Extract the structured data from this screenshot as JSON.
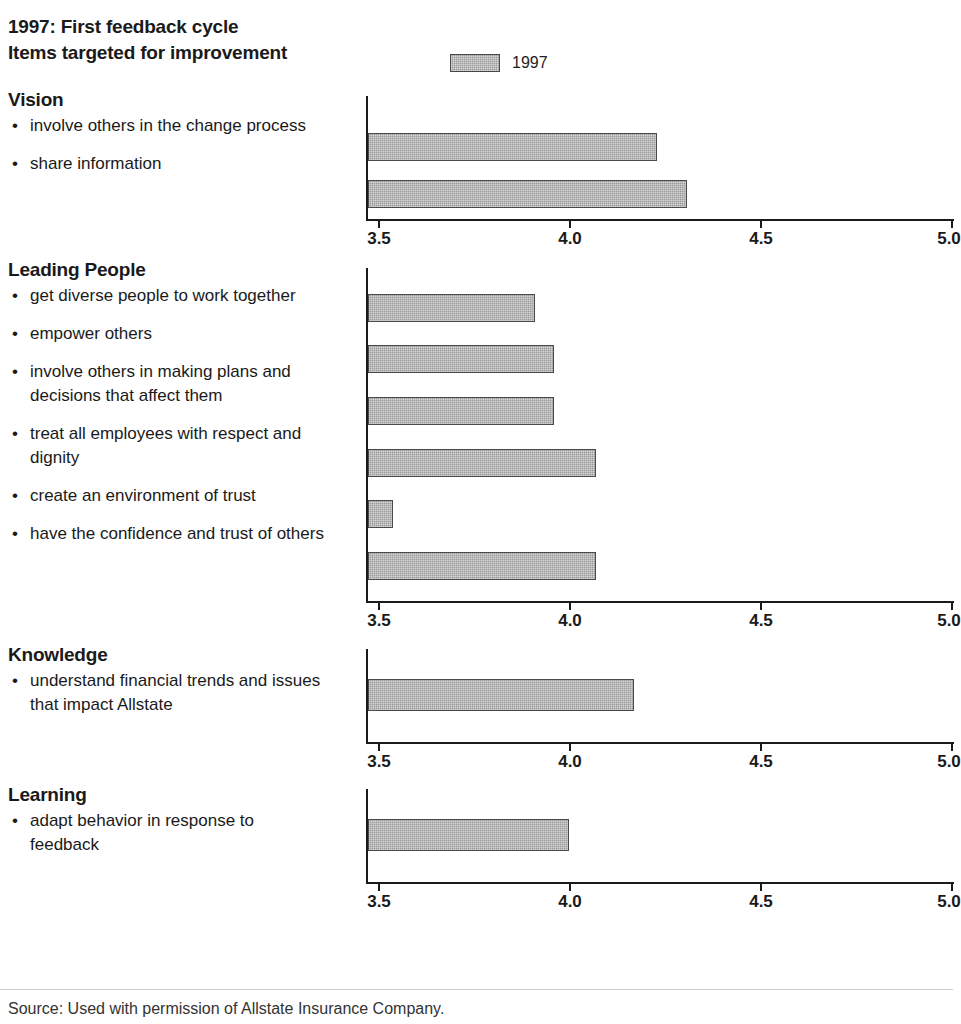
{
  "header": {
    "title_line1": "1997: First feedback cycle",
    "title_line2": "Items targeted for improvement",
    "legend_label": "1997"
  },
  "footer": {
    "source": "Source: Used with permission of Allstate Insurance Company."
  },
  "axis": {
    "ticks": [
      "3.5",
      "4.0",
      "4.5",
      "5.0"
    ],
    "min": 3.5,
    "max": 5.0
  },
  "chart_data": {
    "type": "bar",
    "orientation": "horizontal",
    "xlabel": "",
    "ylabel": "",
    "xlim": [
      3.5,
      5.0
    ],
    "xticks": [
      3.5,
      4.0,
      4.5,
      5.0
    ],
    "grid": false,
    "legend": {
      "entries": [
        "1997"
      ],
      "position": "top-center"
    },
    "series_name": "1997",
    "bar_color": "#9a9a9a",
    "groups": [
      {
        "name": "Vision",
        "categories": [
          "involve others in the change process",
          "share information"
        ],
        "values": [
          4.23,
          4.31
        ]
      },
      {
        "name": "Leading People",
        "categories": [
          "get diverse people to work together",
          "empower others",
          "involve others in making plans and decisions that affect them",
          "treat all employees with respect and dignity",
          "create an environment of trust",
          "have the confidence and trust of others"
        ],
        "values": [
          3.91,
          3.96,
          3.96,
          4.07,
          3.54,
          4.07
        ]
      },
      {
        "name": "Knowledge",
        "categories": [
          "understand financial trends and issues that impact Allstate"
        ],
        "values": [
          4.17
        ]
      },
      {
        "name": "Learning",
        "categories": [
          "adapt behavior in response to feedback"
        ],
        "values": [
          4.0
        ]
      }
    ]
  },
  "sections": [
    {
      "heading": "Vision",
      "items": [
        {
          "bullet": "•",
          "text": "involve others in the change process"
        },
        {
          "bullet": "•",
          "text": "share information"
        }
      ]
    },
    {
      "heading": "Leading People",
      "items": [
        {
          "bullet": "•",
          "text": "get diverse people to work together"
        },
        {
          "bullet": "•",
          "text": "empower others"
        },
        {
          "bullet": "•",
          "text": "involve others in making plans and decisions that affect them"
        },
        {
          "bullet": "•",
          "text": "treat all employees with respect and dignity"
        },
        {
          "bullet": "•",
          "text": "create an environment of trust"
        },
        {
          "bullet": "•",
          "text": "have the confidence and trust of others"
        }
      ]
    },
    {
      "heading": "Knowledge",
      "items": [
        {
          "bullet": "•",
          "text": "understand financial trends and issues that impact Allstate"
        }
      ]
    },
    {
      "heading": "Learning",
      "items": [
        {
          "bullet": "•",
          "text": "adapt behavior in response to feedback"
        }
      ]
    }
  ]
}
